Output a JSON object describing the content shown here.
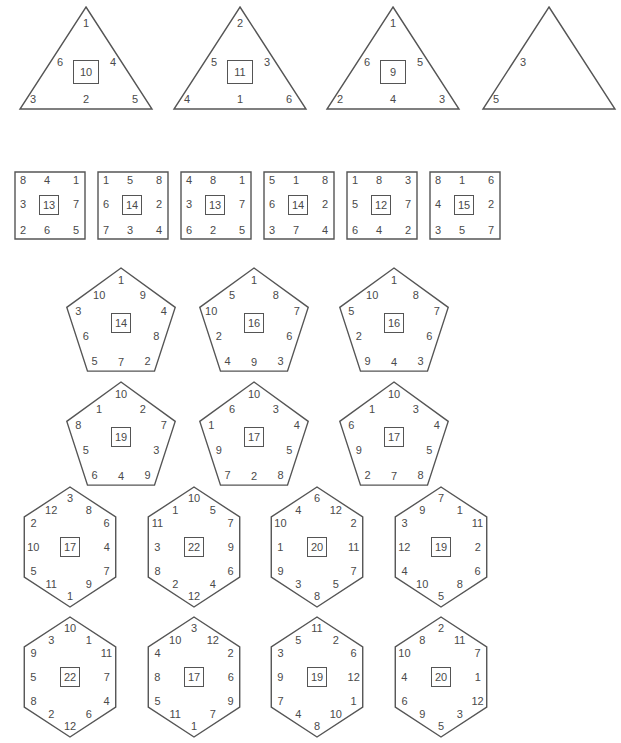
{
  "triangles": [
    {
      "center": "10",
      "top": "1",
      "left": "6",
      "right": "4",
      "bottom_left": "3",
      "bottom": "2",
      "bottom_right": "5"
    },
    {
      "center": "11",
      "top": "2",
      "left": "5",
      "right": "3",
      "bottom_left": "4",
      "bottom": "1",
      "bottom_right": "6"
    },
    {
      "center": "9",
      "top": "1",
      "left": "6",
      "right": "5",
      "bottom_left": "2",
      "bottom": "4",
      "bottom_right": "3"
    },
    {
      "center": "",
      "top": "",
      "left": "3",
      "right": "",
      "bottom_left": "5",
      "bottom": "",
      "bottom_right": ""
    }
  ],
  "squares": [
    {
      "center": "13",
      "cells": [
        "8",
        "4",
        "1",
        "3",
        "7",
        "2",
        "6",
        "5"
      ]
    },
    {
      "center": "14",
      "cells": [
        "1",
        "5",
        "8",
        "6",
        "2",
        "7",
        "3",
        "4"
      ]
    },
    {
      "center": "13",
      "cells": [
        "4",
        "8",
        "1",
        "3",
        "7",
        "6",
        "2",
        "5"
      ]
    },
    {
      "center": "14",
      "cells": [
        "5",
        "1",
        "8",
        "6",
        "2",
        "3",
        "7",
        "4"
      ]
    },
    {
      "center": "12",
      "cells": [
        "1",
        "8",
        "3",
        "5",
        "7",
        "6",
        "4",
        "2"
      ]
    },
    {
      "center": "15",
      "cells": [
        "8",
        "1",
        "6",
        "4",
        "2",
        "3",
        "5",
        "7"
      ]
    }
  ],
  "pentagons": [
    {
      "center": "14",
      "n": [
        "1",
        "9",
        "4",
        "8",
        "2",
        "7",
        "5",
        "6",
        "3",
        "10"
      ]
    },
    {
      "center": "16",
      "n": [
        "1",
        "8",
        "7",
        "6",
        "3",
        "9",
        "4",
        "2",
        "10",
        "5"
      ]
    },
    {
      "center": "16",
      "n": [
        "1",
        "8",
        "7",
        "6",
        "3",
        "4",
        "9",
        "2",
        "5",
        "10"
      ]
    },
    {
      "center": "19",
      "n": [
        "10",
        "2",
        "7",
        "3",
        "9",
        "4",
        "6",
        "5",
        "8",
        "1"
      ]
    },
    {
      "center": "17",
      "n": [
        "10",
        "3",
        "4",
        "5",
        "8",
        "2",
        "7",
        "9",
        "1",
        "6"
      ]
    },
    {
      "center": "17",
      "n": [
        "10",
        "3",
        "4",
        "5",
        "8",
        "7",
        "2",
        "9",
        "6",
        "1"
      ]
    }
  ],
  "hexagons": [
    {
      "center": "17",
      "n": [
        "3",
        "8",
        "6",
        "4",
        "7",
        "9",
        "1",
        "11",
        "5",
        "10",
        "2",
        "12"
      ]
    },
    {
      "center": "22",
      "n": [
        "10",
        "5",
        "7",
        "9",
        "6",
        "4",
        "12",
        "2",
        "8",
        "3",
        "11",
        "1"
      ]
    },
    {
      "center": "20",
      "n": [
        "6",
        "12",
        "2",
        "11",
        "7",
        "5",
        "8",
        "3",
        "9",
        "1",
        "10",
        "4"
      ]
    },
    {
      "center": "19",
      "n": [
        "7",
        "1",
        "11",
        "2",
        "6",
        "8",
        "5",
        "10",
        "4",
        "12",
        "3",
        "9"
      ]
    },
    {
      "center": "22",
      "n": [
        "10",
        "1",
        "11",
        "7",
        "4",
        "6",
        "12",
        "2",
        "8",
        "5",
        "9",
        "3"
      ]
    },
    {
      "center": "17",
      "n": [
        "3",
        "12",
        "2",
        "6",
        "9",
        "7",
        "1",
        "11",
        "5",
        "8",
        "4",
        "10"
      ]
    },
    {
      "center": "19",
      "n": [
        "11",
        "2",
        "6",
        "12",
        "1",
        "10",
        "8",
        "4",
        "7",
        "9",
        "3",
        "5"
      ]
    },
    {
      "center": "20",
      "n": [
        "2",
        "11",
        "7",
        "1",
        "12",
        "3",
        "5",
        "9",
        "6",
        "4",
        "10",
        "8"
      ]
    }
  ]
}
